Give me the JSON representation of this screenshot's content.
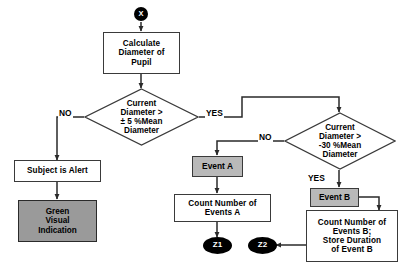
{
  "diagram": {
    "type": "flowchart",
    "background_color": "#ffffff",
    "line_color": "#2a2a2a",
    "nodes": {
      "start": {
        "label": "X",
        "shape": "circle",
        "fill": "#000000",
        "text_color": "#ffffff"
      },
      "calculate": {
        "label": "Calculate\nDiameter of\nPupil",
        "shape": "process",
        "fill": "#ffffff"
      },
      "decision1": {
        "label": "Current\nDiameter >\n± 5 %Mean\nDiameter",
        "shape": "decision",
        "fill": "#ffffff"
      },
      "decision2": {
        "label": "Current\nDiameter >\n-30 %Mean\nDiameter",
        "shape": "decision",
        "fill": "#ffffff"
      },
      "subject_alert": {
        "label": "Subject is Alert",
        "shape": "process",
        "fill": "#ffffff"
      },
      "green_indication": {
        "label": "Green\nVisual\nIndication",
        "shape": "process",
        "fill": "#9a9a9a"
      },
      "event_a": {
        "label": "Event A",
        "shape": "tag",
        "fill": "#b9b9b9"
      },
      "count_a": {
        "label": "Count Number of\nEvents   A",
        "shape": "process",
        "fill": "#ffffff"
      },
      "event_b": {
        "label": "Event B",
        "shape": "tag",
        "fill": "#b9b9b9"
      },
      "count_b": {
        "label": "Count Number of\nEvents  B;\nStore Duration\nof Event  B",
        "shape": "process",
        "fill": "#ffffff"
      },
      "z1": {
        "label": "Z1",
        "shape": "terminator",
        "fill": "#000000",
        "text_color": "#ffffff"
      },
      "z2": {
        "label": "Z2",
        "shape": "terminator",
        "fill": "#000000",
        "text_color": "#ffffff"
      }
    },
    "edge_labels": {
      "d1_no": "NO",
      "d1_yes": "YES",
      "d2_no": "NO",
      "d2_yes": "YES"
    }
  }
}
